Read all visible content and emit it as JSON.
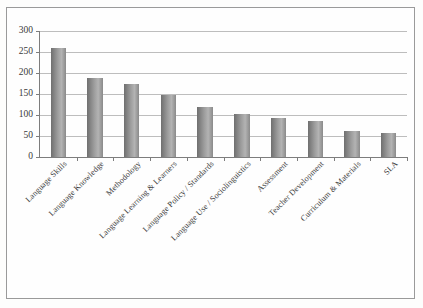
{
  "chart_data": {
    "type": "bar",
    "title": "",
    "subtitle": "",
    "xlabel": "",
    "ylabel": "",
    "ylim": [
      0,
      300
    ],
    "ytick_step": 50,
    "yticks": [
      "0",
      "50",
      "100",
      "150",
      "200",
      "250",
      "300"
    ],
    "grid": true,
    "legend": false,
    "legend_position": "none",
    "orientation": "vertical",
    "bar_color": "#9d9d9d",
    "categories": [
      "Language Skills",
      "Language Knowledge",
      "Methodology",
      "Language Learning & Learners",
      "Language Policy / Standards",
      "Language Use / Sociolinguistics",
      "Assessment",
      "Teacher Development",
      "Curriculum & Materials",
      "SLA"
    ],
    "values": [
      260,
      187,
      175,
      147,
      118,
      103,
      93,
      85,
      62,
      56
    ]
  },
  "figure": {
    "background_color": "#fefefe",
    "frame_color": "#9a9a9a",
    "axis_color": "#7d7d7d",
    "gridline_color": "#bdbdbd"
  }
}
